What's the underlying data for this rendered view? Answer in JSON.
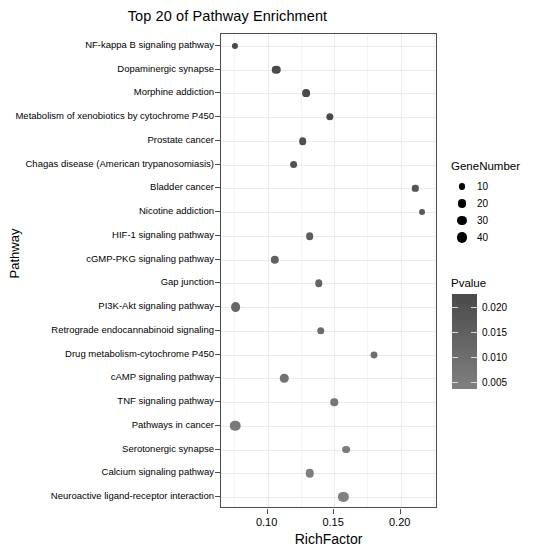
{
  "chart_data": {
    "type": "scatter",
    "title": "Top 20 of Pathway Enrichment",
    "xlabel": "RichFactor",
    "ylabel": "Pathway",
    "xlim": [
      0.065,
      0.228
    ],
    "xticks": [
      0.1,
      0.15,
      0.2
    ],
    "xtick_labels": [
      "0.10",
      "0.15",
      "0.20"
    ],
    "grid": true,
    "legend_position": "right",
    "size_legend": {
      "title": "GeneNumber",
      "values": [
        10,
        20,
        30,
        40
      ],
      "labels": [
        "10",
        "20",
        "30",
        "40"
      ]
    },
    "color_legend": {
      "title": "Pvalue",
      "ticks": [
        0.02,
        0.015,
        0.01,
        0.005
      ],
      "tick_labels": [
        "0.020",
        "0.015",
        "0.010",
        "0.005"
      ],
      "low_color": "#4a4a4a",
      "high_color": "#808080"
    },
    "categories": [
      "NF-kappa B signaling pathway",
      "Dopaminergic synapse",
      "Morphine addiction",
      "Metabolism of xenobiotics by cytochrome P450",
      "Prostate cancer",
      "Chagas disease (American trypanosomiasis)",
      "Bladder cancer",
      "Nicotine addiction",
      "HIF-1 signaling pathway",
      "cGMP-PKG signaling pathway",
      "Gap junction",
      "PI3K-Akt signaling pathway",
      "Retrograde endocannabinoid signaling",
      "Drug metabolism-cytochrome P450",
      "cAMP signaling pathway",
      "TNF signaling pathway",
      "Pathways in cancer",
      "Serotonergic synapse",
      "Calcium signaling pathway",
      "Neuroactive ligand-receptor interaction"
    ],
    "points": [
      {
        "pathway": "NF-kappa B signaling pathway",
        "rich_factor": 0.0755,
        "gene_number": 8,
        "pvalue": 0.0012
      },
      {
        "pathway": "Dopaminergic synapse",
        "rich_factor": 0.1065,
        "gene_number": 22,
        "pvalue": 0.0026
      },
      {
        "pathway": "Morphine addiction",
        "rich_factor": 0.129,
        "gene_number": 17,
        "pvalue": 0.0034
      },
      {
        "pathway": "Metabolism of xenobiotics by cytochrome P450",
        "rich_factor": 0.147,
        "gene_number": 14,
        "pvalue": 0.0041
      },
      {
        "pathway": "Prostate cancer",
        "rich_factor": 0.1265,
        "gene_number": 16,
        "pvalue": 0.0055
      },
      {
        "pathway": "Chagas disease (American trypanosomiasis)",
        "rich_factor": 0.1195,
        "gene_number": 17,
        "pvalue": 0.0068
      },
      {
        "pathway": "Bladder cancer",
        "rich_factor": 0.211,
        "gene_number": 9,
        "pvalue": 0.0079
      },
      {
        "pathway": "Nicotine addiction",
        "rich_factor": 0.216,
        "gene_number": 7,
        "pvalue": 0.0091
      },
      {
        "pathway": "HIF-1 signaling pathway",
        "rich_factor": 0.1315,
        "gene_number": 16,
        "pvalue": 0.0105
      },
      {
        "pathway": "cGMP-PKG signaling pathway",
        "rich_factor": 0.1055,
        "gene_number": 21,
        "pvalue": 0.0118
      },
      {
        "pathway": "Gap junction",
        "rich_factor": 0.1385,
        "gene_number": 15,
        "pvalue": 0.013
      },
      {
        "pathway": "PI3K-Akt signaling pathway",
        "rich_factor": 0.076,
        "gene_number": 33,
        "pvalue": 0.0142
      },
      {
        "pathway": "Retrograde endocannabinoid signaling",
        "rich_factor": 0.14,
        "gene_number": 15,
        "pvalue": 0.0155
      },
      {
        "pathway": "Drug metabolism-cytochrome P450",
        "rich_factor": 0.18,
        "gene_number": 12,
        "pvalue": 0.0168
      },
      {
        "pathway": "cAMP signaling pathway",
        "rich_factor": 0.1125,
        "gene_number": 22,
        "pvalue": 0.018
      },
      {
        "pathway": "TNF signaling pathway",
        "rich_factor": 0.15,
        "gene_number": 15,
        "pvalue": 0.0191
      },
      {
        "pathway": "Pathways in cancer",
        "rich_factor": 0.0755,
        "gene_number": 40,
        "pvalue": 0.0201
      },
      {
        "pathway": "Serotonergic synapse",
        "rich_factor": 0.159,
        "gene_number": 17,
        "pvalue": 0.021
      },
      {
        "pathway": "Calcium signaling pathway",
        "rich_factor": 0.1315,
        "gene_number": 22,
        "pvalue": 0.0218
      },
      {
        "pathway": "Neuroactive ligand-receptor interaction",
        "rich_factor": 0.157,
        "gene_number": 37,
        "pvalue": 0.0225
      }
    ]
  },
  "footer": {
    "caption": ""
  }
}
